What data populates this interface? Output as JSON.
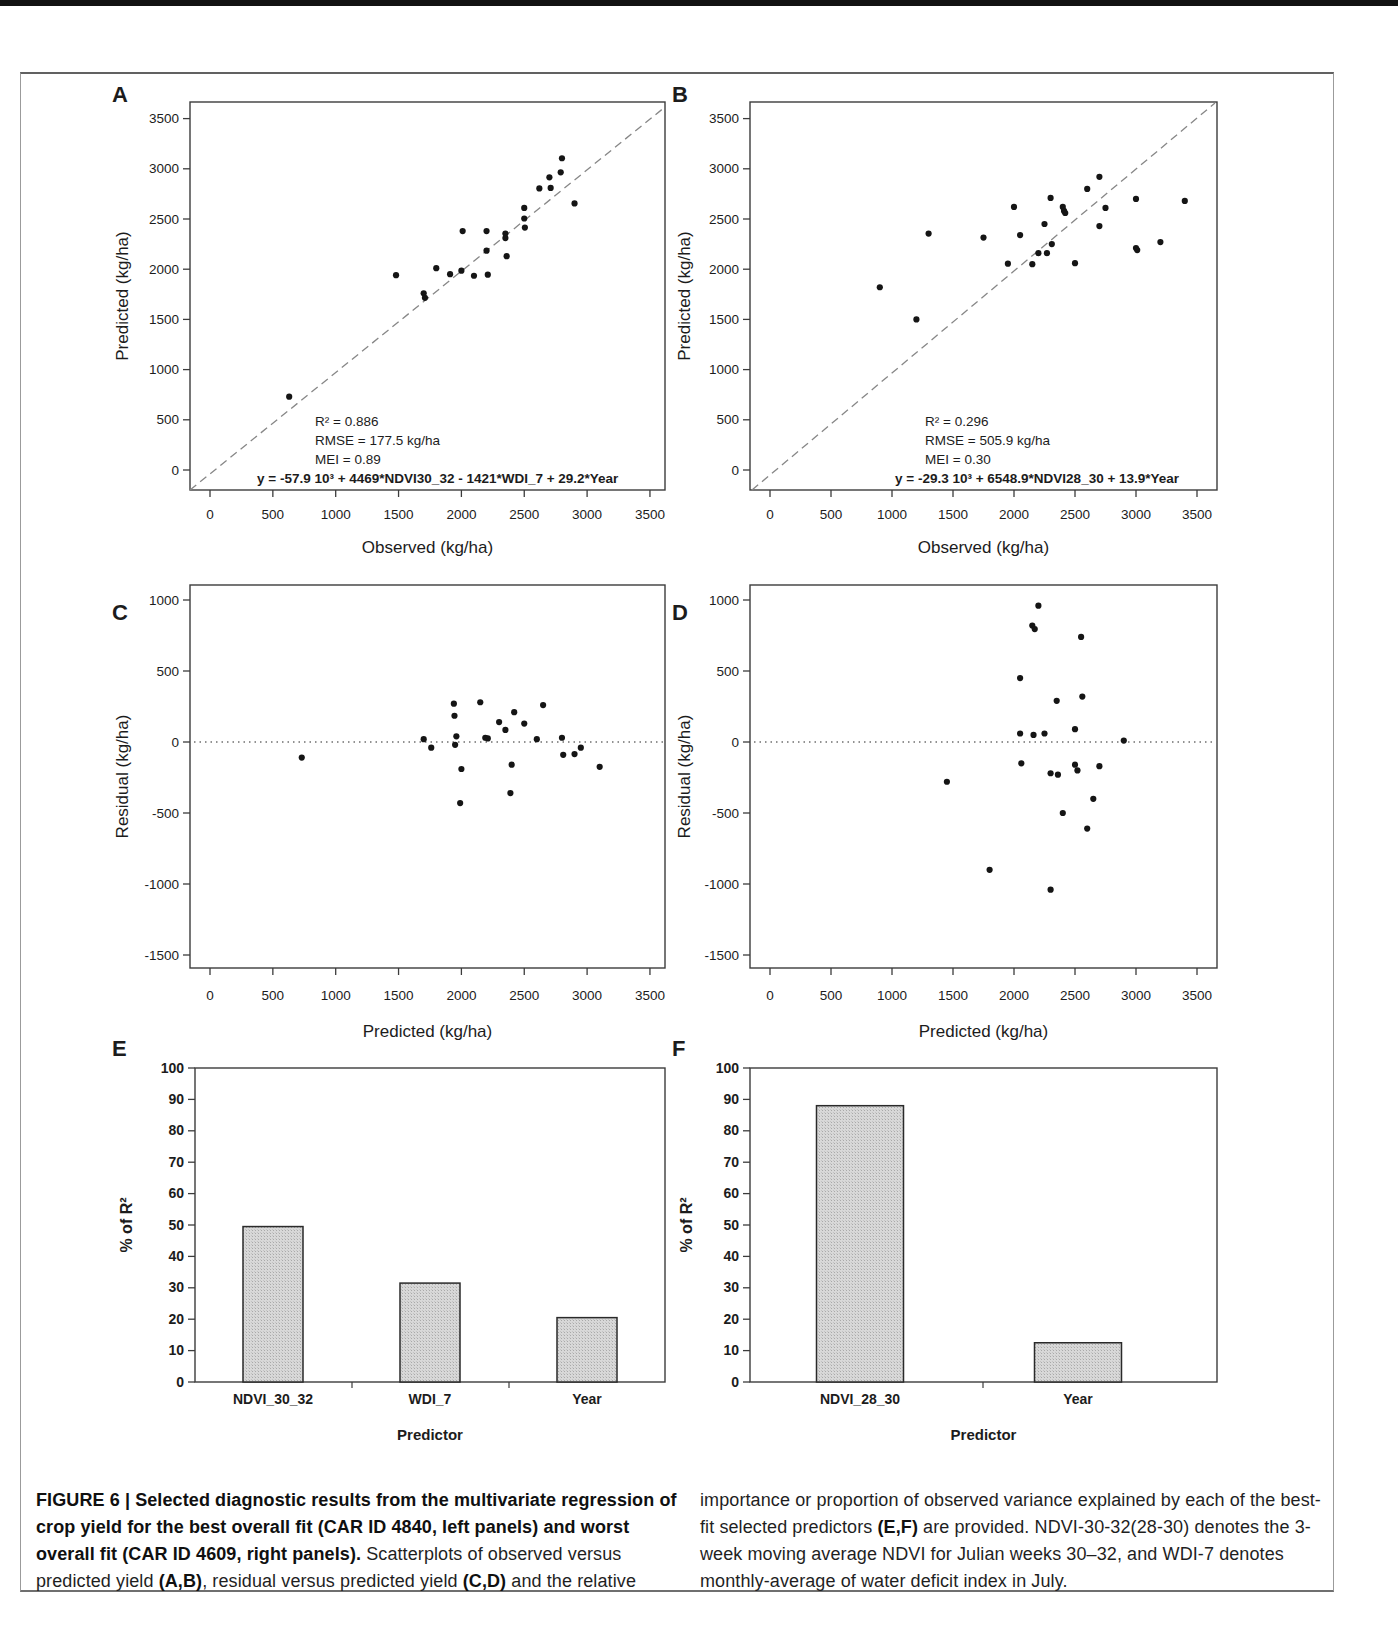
{
  "figure": {
    "caption": {
      "left_segments": [
        {
          "b": 1,
          "t": "FIGURE 6 | Selected diagnostic results from the multivariate regression of crop yield for the best overall fit (CAR ID 4840, left panels) and worst overall fit (CAR ID 4609, right panels)."
        },
        {
          "b": 0,
          "t": " Scatterplots of observed versus predicted yield "
        },
        {
          "b": 1,
          "t": "(A,B)"
        },
        {
          "b": 0,
          "t": ", residual versus predicted yield "
        },
        {
          "b": 1,
          "t": "(C,D)"
        },
        {
          "b": 0,
          "t": " and the relative"
        }
      ],
      "right_segments": [
        {
          "b": 0,
          "t": "importance or proportion of observed variance explained by each of the best-fit selected predictors "
        },
        {
          "b": 1,
          "t": "(E,F)"
        },
        {
          "b": 0,
          "t": " are provided. NDVI-30-32(28-30) denotes the 3-week moving average NDVI for Julian weeks 30–32, and WDI-7 denotes monthly-average of water deficit index in July."
        }
      ]
    }
  },
  "chart_data": [
    {
      "panel": "A",
      "type": "scatter",
      "xlabel": "Observed (kg/ha)",
      "ylabel": "Predicted (kg/ha)",
      "xticks": [
        0,
        500,
        1000,
        1500,
        2000,
        2500,
        3000,
        3500
      ],
      "yticks": [
        0,
        500,
        1000,
        1500,
        2000,
        2500,
        3000,
        3500
      ],
      "xlim": [
        -150,
        3650
      ],
      "ylim": [
        -200,
        3660
      ],
      "ref_line": "identity-diagonal-dashed",
      "stats": [
        "R² =  0.886",
        "RMSE = 177.5 kg/ha",
        "MEI = 0.89"
      ],
      "equation": "y = -57.9 10³ + 4469*NDVI30_32  - 1421*WDI_7  + 29.2*Year",
      "points": [
        [
          630,
          730
        ],
        [
          1480,
          1940
        ],
        [
          1700,
          1760
        ],
        [
          1710,
          1715
        ],
        [
          1800,
          2010
        ],
        [
          1910,
          1950
        ],
        [
          2000,
          1985
        ],
        [
          2010,
          2380
        ],
        [
          2100,
          1935
        ],
        [
          2200,
          2380
        ],
        [
          2200,
          2185
        ],
        [
          2210,
          1945
        ],
        [
          2350,
          2355
        ],
        [
          2350,
          2310
        ],
        [
          2360,
          2130
        ],
        [
          2500,
          2610
        ],
        [
          2500,
          2505
        ],
        [
          2505,
          2415
        ],
        [
          2620,
          2805
        ],
        [
          2700,
          2915
        ],
        [
          2710,
          2810
        ],
        [
          2790,
          2965
        ],
        [
          2800,
          3105
        ],
        [
          2900,
          2655
        ]
      ]
    },
    {
      "panel": "B",
      "type": "scatter",
      "xlabel": "Observed (kg/ha)",
      "ylabel": "Predicted (kg/ha)",
      "xticks": [
        0,
        500,
        1000,
        1500,
        2000,
        2500,
        3000,
        3500
      ],
      "yticks": [
        0,
        500,
        1000,
        1500,
        2000,
        2500,
        3000,
        3500
      ],
      "xlim": [
        -150,
        3660
      ],
      "ylim": [
        -200,
        3660
      ],
      "ref_line": "identity-diagonal-dashed",
      "stats": [
        "R² =  0.296",
        "RMSE = 505.9 kg/ha",
        "MEI = 0.30"
      ],
      "equation": "y = -29.3 10³ + 6548.9*NDVI28_30  + 13.9*Year",
      "points": [
        [
          900,
          1820
        ],
        [
          1200,
          1500
        ],
        [
          1300,
          2355
        ],
        [
          1750,
          2315
        ],
        [
          1950,
          2055
        ],
        [
          2000,
          2620
        ],
        [
          2050,
          2340
        ],
        [
          2150,
          2050
        ],
        [
          2200,
          2160
        ],
        [
          2250,
          2450
        ],
        [
          2270,
          2160
        ],
        [
          2300,
          2710
        ],
        [
          2310,
          2250
        ],
        [
          2400,
          2620
        ],
        [
          2410,
          2580
        ],
        [
          2420,
          2560
        ],
        [
          2500,
          2060
        ],
        [
          2600,
          2800
        ],
        [
          2700,
          2920
        ],
        [
          2700,
          2430
        ],
        [
          2750,
          2610
        ],
        [
          3000,
          2700
        ],
        [
          3000,
          2210
        ],
        [
          3010,
          2190
        ],
        [
          3200,
          2270
        ],
        [
          3400,
          2680
        ]
      ]
    },
    {
      "panel": "C",
      "type": "scatter",
      "xlabel": "Predicted (kg/ha)",
      "ylabel": "Residual (kg/ha)",
      "xticks": [
        0,
        500,
        1000,
        1500,
        2000,
        2500,
        3000,
        3500
      ],
      "yticks": [
        1000,
        500,
        0,
        -500,
        -1000,
        -1500
      ],
      "xlim": [
        -150,
        3650
      ],
      "ylim": [
        -1600,
        1100
      ],
      "ref_line": "zero-horizontal-dotted",
      "stats": [],
      "equation": "",
      "points": [
        [
          730,
          -110
        ],
        [
          1700,
          20
        ],
        [
          1760,
          -40
        ],
        [
          1940,
          270
        ],
        [
          1945,
          185
        ],
        [
          1950,
          -20
        ],
        [
          1960,
          40
        ],
        [
          2000,
          -190
        ],
        [
          1990,
          -430
        ],
        [
          2150,
          280
        ],
        [
          2190,
          30
        ],
        [
          2210,
          25
        ],
        [
          2300,
          140
        ],
        [
          2350,
          85
        ],
        [
          2420,
          210
        ],
        [
          2400,
          -160
        ],
        [
          2390,
          -360
        ],
        [
          2500,
          130
        ],
        [
          2600,
          20
        ],
        [
          2650,
          260
        ],
        [
          2800,
          30
        ],
        [
          2810,
          -90
        ],
        [
          2900,
          -85
        ],
        [
          2950,
          -40
        ],
        [
          3100,
          -175
        ]
      ]
    },
    {
      "panel": "D",
      "type": "scatter",
      "xlabel": "Predicted (kg/ha)",
      "ylabel": "Residual (kg/ha)",
      "xticks": [
        0,
        500,
        1000,
        1500,
        2000,
        2500,
        3000,
        3500
      ],
      "yticks": [
        1000,
        500,
        0,
        -500,
        -1000,
        -1500
      ],
      "xlim": [
        -150,
        3660
      ],
      "ylim": [
        -1600,
        1100
      ],
      "ref_line": "zero-horizontal-dotted",
      "stats": [],
      "equation": "",
      "points": [
        [
          1450,
          -280
        ],
        [
          1800,
          -900
        ],
        [
          2050,
          450
        ],
        [
          2050,
          60
        ],
        [
          2060,
          -150
        ],
        [
          2150,
          820
        ],
        [
          2170,
          795
        ],
        [
          2160,
          50
        ],
        [
          2200,
          960
        ],
        [
          2250,
          60
        ],
        [
          2300,
          -220
        ],
        [
          2300,
          -1040
        ],
        [
          2350,
          290
        ],
        [
          2360,
          -230
        ],
        [
          2400,
          -500
        ],
        [
          2500,
          -160
        ],
        [
          2500,
          90
        ],
        [
          2520,
          -200
        ],
        [
          2550,
          740
        ],
        [
          2560,
          320
        ],
        [
          2600,
          -610
        ],
        [
          2650,
          -400
        ],
        [
          2700,
          -170
        ],
        [
          2900,
          10
        ]
      ]
    },
    {
      "panel": "E",
      "type": "bar",
      "xlabel": "Predictor",
      "ylabel": "% of R²",
      "yticks": [
        0,
        10,
        20,
        30,
        40,
        50,
        60,
        70,
        80,
        90,
        100
      ],
      "ylim": [
        0,
        100
      ],
      "categories": [
        "NDVI_30_32",
        "WDI_7",
        "Year"
      ],
      "values": [
        49.5,
        31.5,
        20.5
      ]
    },
    {
      "panel": "F",
      "type": "bar",
      "xlabel": "Predictor",
      "ylabel": "% of R²",
      "yticks": [
        0,
        10,
        20,
        30,
        40,
        50,
        60,
        70,
        80,
        90,
        100
      ],
      "ylim": [
        0,
        100
      ],
      "categories": [
        "NDVI_28_30",
        "Year"
      ],
      "values": [
        88,
        12.5
      ]
    }
  ]
}
